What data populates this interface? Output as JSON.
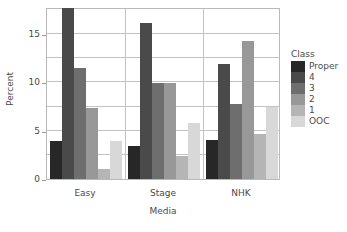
{
  "chart_data": {
    "type": "bar",
    "title": "",
    "xlabel": "Media",
    "ylabel": "Percent",
    "categories": [
      "Easy",
      "Stage",
      "NHK"
    ],
    "ylim": [
      0,
      17.8
    ],
    "yticks": [
      0,
      5,
      10,
      15
    ],
    "ytick_labels": [
      "0",
      "5",
      "10",
      "15"
    ],
    "grid": true,
    "legend_title": "Class",
    "legend_position": "right",
    "series": [
      {
        "name": "Proper",
        "color": "#272727",
        "values": [
          3.9,
          3.4,
          4.0
        ]
      },
      {
        "name": "4",
        "color": "#4a4a4a",
        "values": [
          17.7,
          16.1,
          11.9
        ]
      },
      {
        "name": "3",
        "color": "#6e6e6e",
        "values": [
          11.5,
          9.9,
          7.8
        ]
      },
      {
        "name": "2",
        "color": "#989898",
        "values": [
          7.3,
          9.9,
          14.3
        ]
      },
      {
        "name": "1",
        "color": "#b5b5b5",
        "values": [
          1.0,
          2.4,
          4.7
        ]
      },
      {
        "name": "OOC",
        "color": "#d8d8d8",
        "values": [
          3.9,
          5.8,
          7.5
        ]
      }
    ]
  },
  "axes": {
    "y_title": "Percent",
    "x_title": "Media"
  },
  "legend": {
    "title": "Class",
    "items": [
      {
        "label": "Proper"
      },
      {
        "label": "4"
      },
      {
        "label": "3"
      },
      {
        "label": "2"
      },
      {
        "label": "1"
      },
      {
        "label": "OOC"
      }
    ]
  }
}
